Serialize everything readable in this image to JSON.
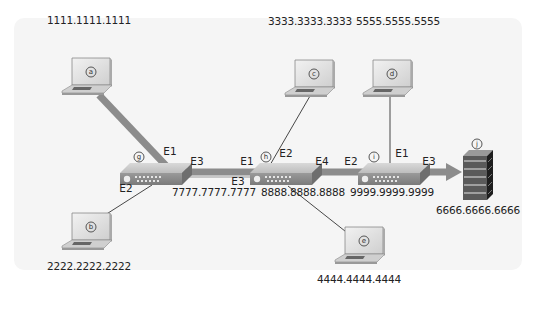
{
  "diagram": {
    "type": "network-topology",
    "nodes": [
      {
        "id": "a",
        "kind": "laptop",
        "address": "1111.1111.1111"
      },
      {
        "id": "b",
        "kind": "laptop",
        "address": "2222.2222.2222"
      },
      {
        "id": "c",
        "kind": "laptop",
        "address": "3333.3333.3333"
      },
      {
        "id": "d",
        "kind": "laptop",
        "address": "5555.5555.5555"
      },
      {
        "id": "e",
        "kind": "laptop",
        "address": "4444.4444.4444"
      },
      {
        "id": "g",
        "kind": "switch",
        "address": "7777.7777.7777"
      },
      {
        "id": "h",
        "kind": "switch",
        "address": "8888.8888.8888"
      },
      {
        "id": "i",
        "kind": "switch",
        "address": "9999.9999.9999"
      },
      {
        "id": "j",
        "kind": "server",
        "address": "6666.6666.6666"
      }
    ],
    "ports": {
      "g_e1": "E1",
      "g_e2": "E2",
      "g_e3": "E3",
      "h_e1": "E1",
      "h_e2": "E2",
      "h_e3": "E3",
      "h_e4": "E4",
      "i_e1": "E1",
      "i_e2": "E2",
      "i_e3": "E3"
    },
    "links": [
      {
        "from": "a",
        "to": "g",
        "port": "E1",
        "highlighted": true
      },
      {
        "from": "b",
        "to": "g",
        "port": "E2",
        "highlighted": false
      },
      {
        "from": "g",
        "to": "h",
        "ports": [
          "E3",
          "E1"
        ],
        "highlighted": true
      },
      {
        "from": "c",
        "to": "h",
        "port": "E2",
        "highlighted": false
      },
      {
        "from": "e",
        "to": "h",
        "port": "E3",
        "highlighted": false
      },
      {
        "from": "h",
        "to": "i",
        "ports": [
          "E4",
          "E2"
        ],
        "highlighted": true
      },
      {
        "from": "d",
        "to": "i",
        "port": "E1",
        "highlighted": false
      },
      {
        "from": "i",
        "to": "j",
        "port": "E3",
        "highlighted": true,
        "arrow": true
      }
    ],
    "colors": {
      "path": "#8c8c8c",
      "thin_link": "#333333",
      "panel": "#f5f5f5"
    }
  }
}
